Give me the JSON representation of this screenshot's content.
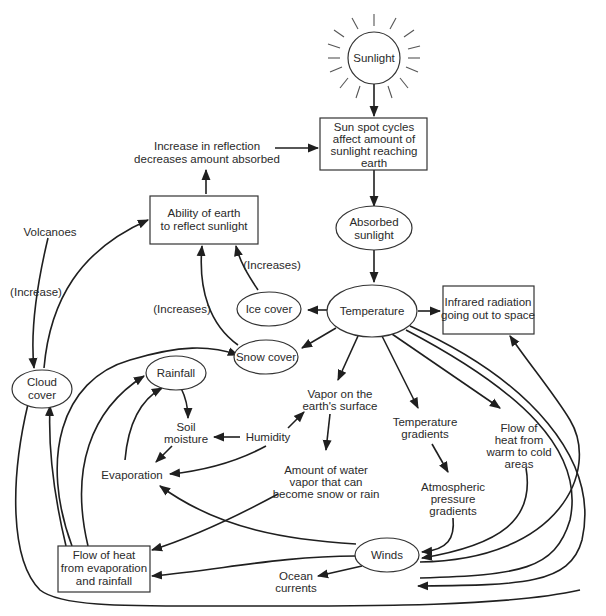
{
  "diagram": {
    "nodes": {
      "sunlight": {
        "lines": [
          "Sunlight"
        ],
        "shape": "sun-circle"
      },
      "sunspot": {
        "lines": [
          "Sun  spot cycles",
          "affect amount of",
          "sunlight reaching",
          "earth"
        ],
        "shape": "box"
      },
      "reflection_increase": {
        "lines": [
          "Increase in reflection",
          "decreases amount absorbed"
        ],
        "shape": "text"
      },
      "ability_reflect": {
        "lines": [
          "Ability of earth",
          "to reflect sunlight"
        ],
        "shape": "box"
      },
      "absorbed": {
        "lines": [
          "Absorbed",
          "sunlight"
        ],
        "shape": "ellipse"
      },
      "volcanoes": {
        "lines": [
          "Volcanoes"
        ],
        "shape": "text"
      },
      "increase_label": {
        "lines": [
          "(Increase)"
        ],
        "shape": "text"
      },
      "increases_label_1": {
        "lines": [
          "(Increases)"
        ],
        "shape": "text"
      },
      "increases_label_2": {
        "lines": [
          "(Increases)"
        ],
        "shape": "text"
      },
      "ice_cover": {
        "lines": [
          "Ice cover"
        ],
        "shape": "ellipse"
      },
      "temperature": {
        "lines": [
          "Temperature"
        ],
        "shape": "ellipse"
      },
      "infrared": {
        "lines": [
          "Infrared radiation",
          "going out to space"
        ],
        "shape": "box"
      },
      "snow_cover": {
        "lines": [
          "Snow cover"
        ],
        "shape": "ellipse"
      },
      "cloud_cover": {
        "lines": [
          "Cloud",
          "cover"
        ],
        "shape": "ellipse"
      },
      "rainfall": {
        "lines": [
          "Rainfall"
        ],
        "shape": "ellipse"
      },
      "vapor_surface": {
        "lines": [
          "Vapor on the",
          "earth's surface"
        ],
        "shape": "text"
      },
      "soil_moisture": {
        "lines": [
          "Soil",
          "moisture"
        ],
        "shape": "text"
      },
      "humidity": {
        "lines": [
          "Humidity"
        ],
        "shape": "text"
      },
      "temp_gradients": {
        "lines": [
          "Temperature",
          "gradients"
        ],
        "shape": "text"
      },
      "flow_warm_cold": {
        "lines": [
          "Flow of",
          "heat from",
          "warm to cold",
          "areas"
        ],
        "shape": "text"
      },
      "evaporation": {
        "lines": [
          "Evaporation"
        ],
        "shape": "text"
      },
      "water_vapor_amount": {
        "lines": [
          "Amount of water",
          "vapor that can",
          "become snow or rain"
        ],
        "shape": "text"
      },
      "atm_pressure": {
        "lines": [
          "Atmospheric",
          "pressure",
          "gradients"
        ],
        "shape": "text"
      },
      "flow_evap_rain": {
        "lines": [
          "Flow of heat",
          "from evaporation",
          "and rainfall"
        ],
        "shape": "box"
      },
      "winds": {
        "lines": [
          "Winds"
        ],
        "shape": "ellipse"
      },
      "ocean_currents": {
        "lines": [
          "Ocean",
          "currents"
        ],
        "shape": "text"
      }
    },
    "edges": [
      [
        "sunlight",
        "sunspot"
      ],
      [
        "reflection_increase",
        "sunspot"
      ],
      [
        "sunspot",
        "absorbed"
      ],
      [
        "ability_reflect",
        "reflection_increase"
      ],
      [
        "absorbed",
        "temperature"
      ],
      [
        "volcanoes",
        "cloud_cover"
      ],
      [
        "cloud_cover",
        "ability_reflect"
      ],
      [
        "ice_cover",
        "ability_reflect"
      ],
      [
        "snow_cover",
        "ability_reflect"
      ],
      [
        "temperature",
        "ice_cover"
      ],
      [
        "temperature",
        "snow_cover"
      ],
      [
        "temperature",
        "infrared"
      ],
      [
        "temperature",
        "vapor_surface"
      ],
      [
        "temperature",
        "temp_gradients"
      ],
      [
        "temperature",
        "flow_warm_cold"
      ],
      [
        "temperature",
        "winds"
      ],
      [
        "temperature",
        "ocean_currents"
      ],
      [
        "flow_evap_rain",
        "snow_cover"
      ],
      [
        "flow_evap_rain",
        "rainfall"
      ],
      [
        "flow_evap_rain",
        "cloud_cover"
      ],
      [
        "evaporation",
        "rainfall"
      ],
      [
        "rainfall",
        "soil_moisture"
      ],
      [
        "soil_moisture",
        "evaporation"
      ],
      [
        "humidity",
        "soil_moisture"
      ],
      [
        "humidity",
        "vapor_surface"
      ],
      [
        "humidity",
        "evaporation"
      ],
      [
        "vapor_surface",
        "water_vapor_amount"
      ],
      [
        "water_vapor_amount",
        "flow_evap_rain"
      ],
      [
        "temp_gradients",
        "atm_pressure"
      ],
      [
        "atm_pressure",
        "winds"
      ],
      [
        "flow_warm_cold",
        "winds"
      ],
      [
        "winds",
        "evaporation"
      ],
      [
        "winds",
        "flow_evap_rain"
      ],
      [
        "winds",
        "ocean_currents"
      ],
      [
        "winds",
        "infrared"
      ],
      [
        "cloud_cover",
        "ocean_currents"
      ]
    ]
  }
}
